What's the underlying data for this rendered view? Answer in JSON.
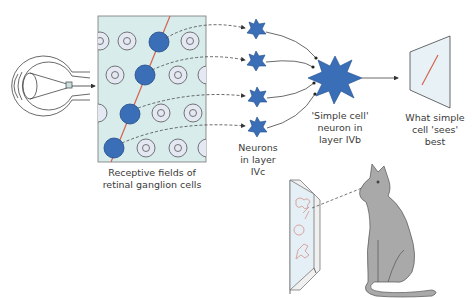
{
  "labels": {
    "receptive_fields": "Receptive fields of\nretinal ganglion cells",
    "neurons_ivc": "Neurons\nin layer\nIVc",
    "simple_cell": "'Simple cell'\nneuron in\nlayer IVb",
    "what_sees": "What simple\ncell 'sees'\nbest"
  },
  "colors": {
    "panel_fill": "#d8ecec",
    "ring_fill": "#e4e8f2",
    "neuron_blue": "#3a6fb8",
    "neuron_stroke": "#1f4a86",
    "bar_red": "#d4624f",
    "cat_gray": "#a9a9a9",
    "line": "#444444"
  },
  "elements": {
    "eye-icon": "eye",
    "receptive-field-panel": "panel",
    "layer-ivc-neurons": 4,
    "simple-cell-neuron": 1,
    "oriented-bar-screen": "screen",
    "cat-illustration": "cat"
  }
}
